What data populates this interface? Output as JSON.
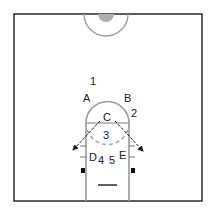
{
  "diagram": {
    "type": "basketball-half-court",
    "colors": {
      "frame": "#1a1a1a",
      "court_line": "#9a9a9a",
      "center_dot": "#b0b0b0",
      "arrow": "#1a1a1a",
      "block": "#111111"
    },
    "positions": [
      {
        "id": "1",
        "label": "1",
        "x": 88,
        "y": 85
      },
      {
        "id": "A",
        "label": "A",
        "x": 83,
        "y": 101
      },
      {
        "id": "B",
        "label": "B",
        "x": 123,
        "y": 101
      },
      {
        "id": "2",
        "label": "2",
        "x": 131,
        "y": 116
      },
      {
        "id": "C",
        "label": "C",
        "x": 103,
        "y": 121
      },
      {
        "id": "3",
        "label": "3",
        "x": 103,
        "y": 138
      },
      {
        "id": "D",
        "label": "D",
        "x": 88,
        "y": 160
      },
      {
        "id": "4",
        "label": "4",
        "x": 97,
        "y": 163
      },
      {
        "id": "5",
        "label": "5",
        "x": 109,
        "y": 163
      },
      {
        "id": "E",
        "label": "E",
        "x": 119,
        "y": 160
      }
    ]
  }
}
